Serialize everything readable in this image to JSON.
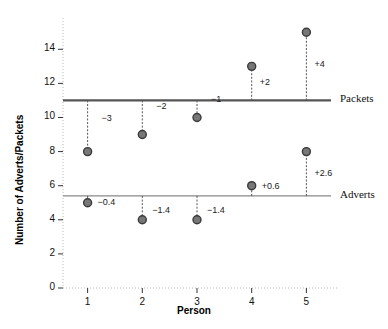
{
  "chart_data": {
    "type": "scatter",
    "title": "",
    "xlabel": "Person",
    "ylabel": "Number of Adverts/Packets",
    "x": [
      1,
      2,
      3,
      4,
      5
    ],
    "xtick_labels": [
      "1",
      "2",
      "3",
      "4",
      "5"
    ],
    "xlim": [
      0.55,
      5.45
    ],
    "ytick_labels": [
      "0",
      "2",
      "4",
      "6",
      "8",
      "10",
      "12",
      "14"
    ],
    "yticks": [
      0,
      2,
      4,
      6,
      8,
      10,
      12,
      14
    ],
    "ylim": [
      0,
      15.6
    ],
    "grid": false,
    "legend_position": "right-inline",
    "series": [
      {
        "name": "Packets",
        "label": "Packets",
        "mean_line": 11,
        "mean_line_color": "#555555",
        "values": [
          8,
          9,
          10,
          13,
          15
        ],
        "deviations": [
          "−3",
          "−2",
          "−1",
          "+2",
          "+4"
        ],
        "marker_color": "#777777",
        "marker_edge_color": "#3a3a3a"
      },
      {
        "name": "Adverts",
        "label": "Adverts",
        "mean_line": 5.4,
        "mean_line_color": "#888888",
        "values": [
          5,
          4,
          4,
          6,
          8
        ],
        "deviations": [
          "−0.4",
          "−1.4",
          "−1.4",
          "+0.6",
          "+2.6"
        ],
        "marker_color": "#777777",
        "marker_edge_color": "#3a3a3a"
      }
    ],
    "annotations": [
      {
        "text": "−3",
        "x": 1,
        "y": 9.9,
        "dx": 14,
        "series": "Packets"
      },
      {
        "text": "−2",
        "x": 2,
        "y": 10.6,
        "dx": 14,
        "series": "Packets"
      },
      {
        "text": "−1",
        "x": 3,
        "y": 11.0,
        "dx": 14,
        "series": "Packets"
      },
      {
        "text": "+2",
        "x": 4,
        "y": 12.0,
        "dx": 8,
        "series": "Packets"
      },
      {
        "text": "+4",
        "x": 5,
        "y": 13.1,
        "dx": 8,
        "series": "Packets"
      },
      {
        "text": "−0.4",
        "x": 1,
        "y": 5.0,
        "dx": 10,
        "series": "Adverts"
      },
      {
        "text": "−1.4",
        "x": 2,
        "y": 4.5,
        "dx": 10,
        "series": "Adverts"
      },
      {
        "text": "−1.4",
        "x": 3,
        "y": 4.5,
        "dx": 10,
        "series": "Adverts"
      },
      {
        "text": "+0.6",
        "x": 4,
        "y": 5.9,
        "dx": 10,
        "series": "Adverts"
      },
      {
        "text": "+2.6",
        "x": 5,
        "y": 6.7,
        "dx": 8,
        "series": "Adverts"
      }
    ]
  }
}
